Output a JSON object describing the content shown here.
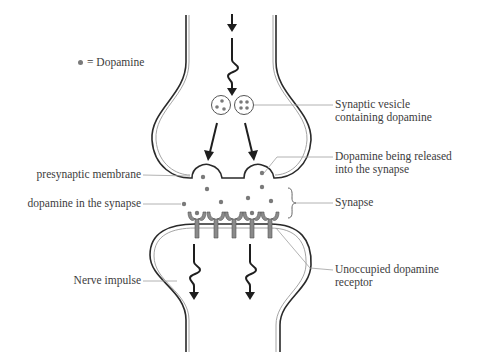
{
  "legend": {
    "symbol": "dot",
    "label": "= Dopamine"
  },
  "labels": {
    "synaptic_vesicle": [
      "Synaptic vesicle",
      "containing dopamine"
    ],
    "presynaptic_membrane": "presynaptic membrane",
    "dopamine_released": [
      "Dopamine being released",
      "into the synapse"
    ],
    "dopamine_in_synapse": "dopamine in the synapse",
    "synapse": "Synapse",
    "nerve_impulse": "Nerve impulse",
    "unoccupied_receptor": [
      "Unoccupied dopamine",
      "receptor"
    ]
  },
  "colors": {
    "membrane_dark": "#2a2a2a",
    "membrane_light": "#9a9a9a",
    "dopamine": "#7a7a7a",
    "receptor": "#8a8a8a",
    "leader_line": "#a0a0a0",
    "arrow": "#1e1e1e"
  }
}
